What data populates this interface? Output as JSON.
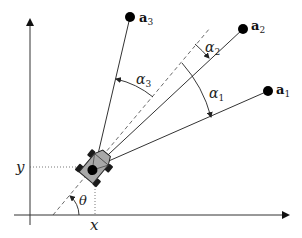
{
  "diagram": {
    "type": "robot-bearing-geometry",
    "axes": {
      "x_label": "x",
      "y_label": "y"
    },
    "robot": {
      "center": [
        95,
        167
      ],
      "heading_angle_label": "θ"
    },
    "landmarks": [
      {
        "id": "a1",
        "base": "a",
        "sub": "1",
        "pos": [
          268,
          91
        ]
      },
      {
        "id": "a2",
        "base": "a",
        "sub": "2",
        "pos": [
          243,
          29
        ]
      },
      {
        "id": "a3",
        "base": "a",
        "sub": "3",
        "pos": [
          130,
          17
        ]
      }
    ],
    "bearing_angles": [
      {
        "id": "alpha1",
        "base": "α",
        "sub": "1"
      },
      {
        "id": "alpha2",
        "base": "α",
        "sub": "2"
      },
      {
        "id": "alpha3",
        "base": "α",
        "sub": "3"
      }
    ],
    "colors": {
      "line": "#333333",
      "robot_body": "#a8a8a8",
      "wheel": "#1a1a1a",
      "landmark": "#000000"
    }
  }
}
